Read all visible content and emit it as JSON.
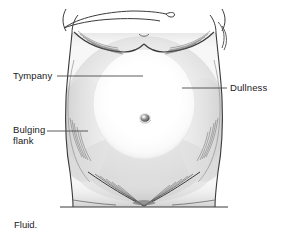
{
  "figure": {
    "name": "abdomen-ascites-percussion-illustration",
    "caption": "Fluid."
  },
  "labels": {
    "tympany": "Tympany",
    "dullness": "Dullness",
    "bulging_flank_line1": "Bulging",
    "bulging_flank_line2": "flank"
  },
  "colors": {
    "background": "#ffffff",
    "text": "#1a1a1a",
    "outline": "#3a3a3a",
    "leader_line": "#4a4a4a",
    "dullness_shade": "#cfcfcf",
    "tympany_highlight": "#ffffff",
    "hatch": "#555555",
    "umbilicus": "#4a4a4a"
  }
}
